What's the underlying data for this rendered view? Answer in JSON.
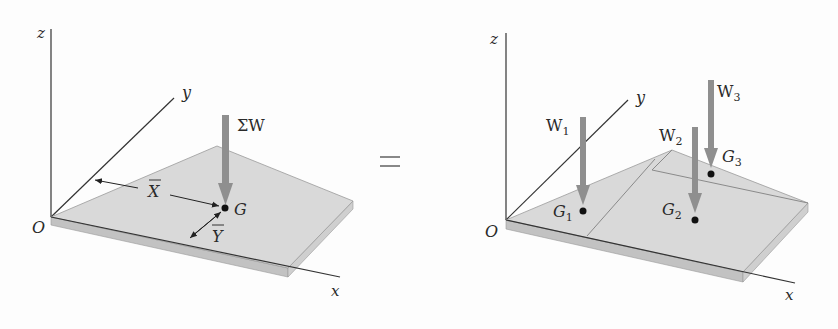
{
  "figure": {
    "left": {
      "axes": {
        "z": "z",
        "y": "y",
        "x": "x",
        "origin": "O"
      },
      "force_label": "ΣW",
      "centroid_label": "G",
      "dim_x": "X",
      "dim_y": "Y"
    },
    "equals": "=",
    "right": {
      "axes": {
        "z": "z",
        "y": "y",
        "x": "x",
        "origin": "O"
      },
      "forces": [
        {
          "label": "W",
          "sub": "1",
          "point": "G",
          "point_sub": "1"
        },
        {
          "label": "W",
          "sub": "2",
          "point": "G",
          "point_sub": "2"
        },
        {
          "label": "W",
          "sub": "3",
          "point": "G",
          "point_sub": "3"
        }
      ]
    },
    "colors": {
      "plate_top": "#d9d9d9",
      "plate_edge": "#bdbdbd",
      "arrow": "#8f8f8f",
      "line": "#333333"
    }
  }
}
